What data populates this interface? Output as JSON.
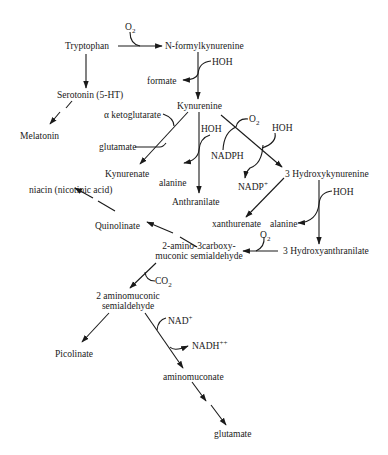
{
  "diagram": {
    "colors": {
      "line": "#1a1a1a",
      "text": "#1a1a1a",
      "background": "#ffffff"
    },
    "nodes": {
      "tryptophan": "Tryptophan",
      "n_formylkynurenine": "N-formylkynurenine",
      "formate": "formate",
      "serotonin": "Serotonin (5-HT)",
      "melatonin": "Melatonin",
      "kynurenine": "Kynurenine",
      "alpha_ketoglutarate": "α ketoglutarate",
      "glutamate_1": "glutamate",
      "kynurenate": "Kynurenate",
      "alanine_1": "alanine",
      "anthranilate": "Anthranilate",
      "nadph": "NADPH",
      "nadp_plus": "NADP",
      "nadp_plus_sup": "+",
      "hydroxykynurenine": "3 Hydroxykynurenine",
      "xanthurenate": "xanthurenate",
      "alanine_2": "alanine",
      "hydroxyanthranilate": "3 Hydroxyanthranilate",
      "niacin": "niacin (nicotinic acid)",
      "quinolinate": "Quinolinate",
      "acms_line1": "2-amino-3carboxy-",
      "acms_line2": "muconic semialdehyde",
      "ams_line1": "2 aminomuconic",
      "ams_line2": "semialdehyde",
      "picolinate": "Picolinate",
      "nad_plus": "NAD",
      "nad_plus_sup": "+",
      "nadh": "NADH",
      "nadh_sup": "++",
      "aminomuconate": "aminomuconate",
      "glutamate_2": "glutamate"
    },
    "cofactors": {
      "o2_1": "O",
      "o2_1_sub": "2",
      "o2_2": "O",
      "o2_2_sub": "2",
      "o2_3": "O",
      "o2_3_sub": "2",
      "hoh_1": "HOH",
      "hoh_2": "HOH",
      "hoh_3": "HOH",
      "hoh_4": "HOH",
      "co2": "CO",
      "co2_sub": "2"
    }
  }
}
